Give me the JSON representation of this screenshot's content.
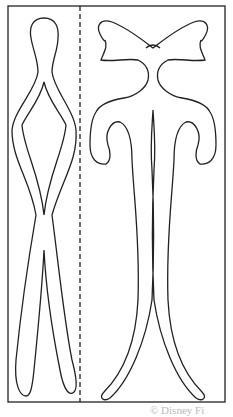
{
  "diagram": {
    "type": "cut-out template",
    "frame": {
      "x": 8,
      "y": 6,
      "width": 217,
      "height": 396,
      "stroke": "#222222"
    },
    "fold_line": {
      "x": 80,
      "style": "dashed"
    },
    "shapes": [
      {
        "name": "left-piece",
        "description": "tall narrow figure with rounded head, diamond opening and split legs"
      },
      {
        "name": "right-piece",
        "description": "bow on top with two curled scroll arms descending to split legs"
      }
    ],
    "caption": "© Disney Fi"
  }
}
